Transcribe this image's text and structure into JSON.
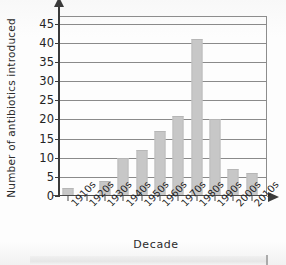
{
  "chart_data": {
    "type": "bar",
    "title": "",
    "xlabel": "Decade",
    "ylabel": "Number of antibiotics introduced",
    "categories": [
      "1910s",
      "1920s",
      "1930s",
      "1940s",
      "1950s",
      "1960s",
      "1970s",
      "1980s",
      "1990s",
      "2000s",
      "2010s"
    ],
    "values": [
      2,
      0,
      4,
      10,
      12,
      17,
      21,
      41,
      20,
      7,
      6
    ],
    "ylim": [
      0,
      47
    ],
    "yticks": [
      0,
      5,
      10,
      15,
      20,
      25,
      30,
      35,
      40,
      45
    ],
    "ytick_labels": [
      "0",
      "5",
      "10",
      "15",
      "20",
      "25",
      "30",
      "35",
      "40",
      "45"
    ],
    "grid": "horizontal",
    "legend": "none",
    "bar_color": "#c7c7c7",
    "axis_color": "#3b3b3b",
    "gridline_color": "#8a8a8a"
  }
}
